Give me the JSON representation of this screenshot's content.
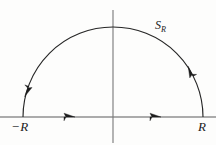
{
  "figure": {
    "kind": "semicircular-contour-diagram",
    "title_text": "",
    "background_color": "#fdfdfc",
    "stroke_color": "#262626",
    "axis_color": "#555555",
    "labels": {
      "left_endpoint": "−R",
      "right_endpoint": "R",
      "arc_symbol_base": "S",
      "arc_symbol_subscript": "R"
    },
    "geometry": {
      "center_x": 113,
      "center_y": 117,
      "radius": 90,
      "real_axis_y": 117,
      "real_axis_x_start": 0,
      "real_axis_x_end": 216,
      "imag_axis_x": 113,
      "imag_axis_y_start": 10,
      "imag_axis_y_end": 143,
      "arc_start_x": 23,
      "arc_end_x": 203,
      "arc_apex_y": 27
    },
    "direction_markers": {
      "axis_arrow_1_x": 70,
      "axis_arrow_2_x": 156,
      "arc_arrow_left_angle_deg": 160,
      "arc_arrow_right_angle_deg": 27,
      "orientation": "counterclockwise"
    }
  }
}
